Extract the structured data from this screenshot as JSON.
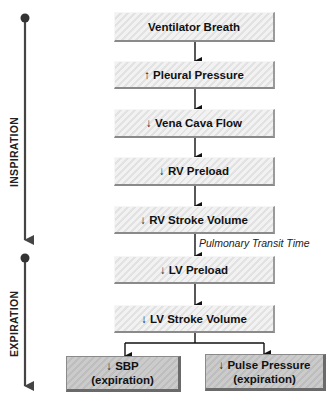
{
  "timeline": {
    "phases": [
      {
        "label": "INSPIRATION"
      },
      {
        "label": "EXPIRATION"
      }
    ],
    "colors": {
      "line": "#444444",
      "dot": "#333333"
    }
  },
  "flow": {
    "steps": [
      {
        "label": "Ventilator Breath"
      },
      {
        "label": "↑ Pleural Pressure"
      },
      {
        "label": "↓ Vena Cava Flow"
      },
      {
        "label": "↓ RV Preload"
      },
      {
        "label": "↓ RV Stroke Volume"
      },
      {
        "label": "↓ LV Preload"
      },
      {
        "label": "↓ LV Stroke Volume"
      }
    ],
    "transit_annotation": "Pulmonary Transit Time",
    "outcomes": [
      {
        "line1": "↓ SBP",
        "line2": "(expiration)"
      },
      {
        "line1": "↓ Pulse Pressure",
        "line2": "(expiration)"
      }
    ]
  }
}
